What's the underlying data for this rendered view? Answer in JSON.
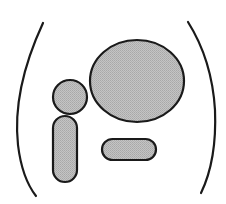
{
  "diagram": {
    "colors": {
      "background": "#ffffff",
      "stroke": "#1a1a1a",
      "fill": "#b8b8b8"
    },
    "shapes": [
      {
        "name": "left-arc",
        "kind": "arc"
      },
      {
        "name": "right-arc",
        "kind": "arc"
      },
      {
        "name": "large-ellipse",
        "kind": "ellipse"
      },
      {
        "name": "small-circle",
        "kind": "circle"
      },
      {
        "name": "vertical-pill",
        "kind": "rounded-rect"
      },
      {
        "name": "horizontal-pill",
        "kind": "rounded-rect"
      }
    ]
  }
}
